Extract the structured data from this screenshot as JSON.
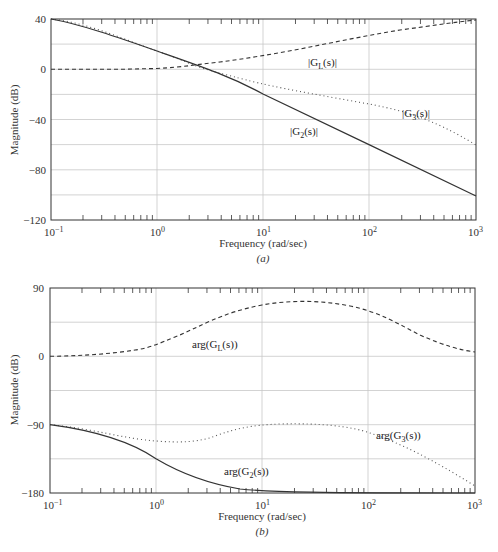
{
  "chart_data": [
    {
      "panel": "(a)",
      "type": "line",
      "title": "",
      "caption": "(a)",
      "xlabel": "Frequency (rad/sec)",
      "ylabel": "Magnitude (dB)",
      "xscale": "log",
      "xlim": [
        0.1,
        1000
      ],
      "ylim": [
        -120,
        40
      ],
      "grid": true,
      "xticks": [
        "10^-1",
        "10^0",
        "10^1",
        "10^2",
        "10^3"
      ],
      "yticks": [
        "40",
        "0",
        "-40",
        "-80",
        "-120"
      ],
      "x": [
        0.1,
        0.3,
        1,
        2.5,
        3,
        10,
        30,
        100,
        300,
        1000
      ],
      "series": [
        {
          "name": "|G_L(s)|",
          "style": "dashed",
          "values": [
            0,
            0,
            1,
            3,
            4,
            10,
            20,
            29,
            35,
            38
          ]
        },
        {
          "name": "|G_3(s)|",
          "style": "dotted",
          "values": [
            40,
            31,
            14,
            3,
            0,
            -12,
            -22,
            -30,
            -42,
            -60
          ]
        },
        {
          "name": "|G_2(s)|",
          "style": "solid",
          "values": [
            40,
            31,
            14,
            3,
            0,
            -20,
            -40,
            -60,
            -80,
            -101
          ]
        }
      ],
      "annotations": [
        "|G_L(s)|",
        "|G_3(s)|",
        "|G_2(s)|"
      ]
    },
    {
      "panel": "(b)",
      "type": "line",
      "title": "",
      "caption": "(b)",
      "xlabel": "Frequency (rad/sec)",
      "ylabel": "Magnitude (dB)",
      "xscale": "log",
      "xlim": [
        0.1,
        1000
      ],
      "ylim": [
        -180,
        90
      ],
      "grid": true,
      "xticks": [
        "10^-1",
        "10^0",
        "10^1",
        "10^2",
        "10^3"
      ],
      "yticks": [
        "90",
        "0",
        "-90",
        "-180"
      ],
      "x": [
        0.1,
        0.3,
        1,
        3,
        10,
        30,
        100,
        300,
        1000
      ],
      "series": [
        {
          "name": "arg(G_L(s))",
          "style": "dashed",
          "values": [
            0,
            3,
            17,
            45,
            68,
            75,
            67,
            40,
            17
          ]
        },
        {
          "name": "arg(G_3(s))",
          "style": "dotted",
          "values": [
            -90,
            -97,
            -115,
            -112,
            -100,
            -98,
            -105,
            -130,
            -165
          ]
        },
        {
          "name": "arg(G_2(s))",
          "style": "solid",
          "values": [
            -90,
            -107,
            -135,
            -162,
            -174,
            -178,
            -180,
            -180,
            -180
          ]
        }
      ],
      "annotations": [
        "arg(G_L(s))",
        "arg(G_3(s))",
        "arg(G_2(s))"
      ]
    }
  ],
  "labels": {
    "a": {
      "ylabel": "Magnitude (dB)",
      "xlabel": "Frequency (rad/sec)",
      "caption": "(a)",
      "yticks": [
        "40",
        "0",
        "−40",
        "−80",
        "−120"
      ],
      "xticks_base": [
        "10",
        "10",
        "10",
        "10",
        "10"
      ],
      "xticks_exp": [
        "−1",
        "0",
        "1",
        "2",
        "3"
      ],
      "gl": "|G",
      "gl_sub": "L",
      "gl_tail": "(s)|",
      "g3": "|G",
      "g3_sub": "3",
      "g3_tail": "(s)|",
      "g2": "|G",
      "g2_sub": "2",
      "g2_tail": "(s)|"
    },
    "b": {
      "ylabel": "Magnitude (dB)",
      "xlabel": "Frequency (rad/sec)",
      "caption": "(b)",
      "yticks": [
        "90",
        "0",
        "−90",
        "−180"
      ],
      "xticks_base": [
        "10",
        "10",
        "10",
        "10",
        "10"
      ],
      "xticks_exp": [
        "−1",
        "0",
        "1",
        "2",
        "3"
      ],
      "gl": "arg(G",
      "gl_sub": "L",
      "gl_tail": "(s))",
      "g3": "arg(G",
      "g3_sub": "3",
      "g3_tail": "(s))",
      "g2": "arg(G",
      "g2_sub": "2",
      "g2_tail": "(s))"
    }
  }
}
